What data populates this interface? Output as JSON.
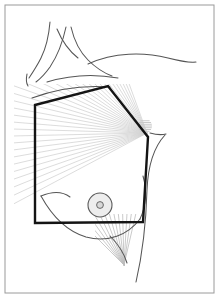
{
  "figure": {
    "caption": "",
    "width": 219,
    "height": 298,
    "background_color": "#ffffff"
  },
  "frame": {
    "name": "figure-border",
    "x": 5,
    "y": 5,
    "width": 209,
    "height": 288,
    "stroke_color": "#9a9a9a",
    "stroke_width": 1
  },
  "colors": {
    "field_outline": "#141414",
    "body_contour": "#555555",
    "ray_light": "#d3d3d3",
    "ray_mid": "#bdbdbd",
    "areola_stroke": "#5a5a5a",
    "areola_fill": "#ededed",
    "nipple_fill": "#d8d8d8",
    "axilla_shade": "#c9c9c9",
    "frame": "#9a9a9a"
  },
  "treatment_field": {
    "name": "tangential-field-polygon",
    "shape": "pentagon",
    "stroke_width": 2.4,
    "stroke_color": "#141414",
    "vertices": [
      {
        "label": "superomedial",
        "x": 35,
        "y": 105
      },
      {
        "label": "superior-apex",
        "x": 108,
        "y": 86
      },
      {
        "label": "lateral-apex",
        "x": 148,
        "y": 137
      },
      {
        "label": "inferolateral",
        "x": 143,
        "y": 222
      },
      {
        "label": "inferomedial",
        "x": 35,
        "y": 223
      }
    ]
  },
  "ray_fan_main": {
    "name": "primary-beam-fan",
    "apex_x": 147,
    "apex_y": 133,
    "count": 34,
    "angle_start_deg": 152,
    "angle_end_deg": 250,
    "length": 185,
    "stroke_color": "#d3d3d3",
    "stroke_width": 0.8
  },
  "ray_fan_inferior": {
    "name": "inframammary-beam-fan",
    "apex_x": 124,
    "apex_y": 265,
    "count": 13,
    "angle_start_deg": 225,
    "angle_end_deg": 283,
    "length": 70,
    "stroke_color": "#bdbdbd",
    "stroke_width": 0.8
  },
  "areola": {
    "name": "nipple-areola-complex",
    "center_x": 100,
    "center_y": 205,
    "outer_radius": 12,
    "inner_radius": 3.4,
    "outer_stroke": "#5a5a5a",
    "outer_fill": "#ededed",
    "inner_fill": "#d8d8d8"
  },
  "axilla_marker": {
    "name": "axillary-apex-shading",
    "center_x": 145,
    "center_y": 126,
    "radius": 7,
    "fill": "#c9c9c9"
  },
  "body_contours": [
    {
      "name": "neck-anterior-border",
      "path": "M 50 22 C 49 34, 47 46, 41 58 C 37 66, 33 72, 29 78"
    },
    {
      "name": "sternocleidomastoid-medial",
      "path": "M 66 27 C 63 41, 58 55, 50 67 C 45 74, 40 79, 36 82"
    },
    {
      "name": "sternocleidomastoid-lateral",
      "path": "M 71 27 C 74 40, 80 52, 88 60 C 96 68, 104 73, 112 76"
    },
    {
      "name": "supraclavicular-fossa",
      "path": "M 57 29 C 62 41, 69 51, 78 58"
    },
    {
      "name": "neck-base-tick",
      "path": "M 27 74 C 26 79, 26 83, 28 86"
    },
    {
      "name": "clavicle-line",
      "path": "M 47 82 C 70 75, 96 74, 118 78"
    },
    {
      "name": "shoulder-trapezius-line",
      "path": "M 88 64 C 114 52, 144 52, 168 58 C 180 61, 188 63, 196 62"
    },
    {
      "name": "chest-upper-slope",
      "path": "M 32 98 C 56 89, 84 85, 110 87"
    },
    {
      "name": "breast-superior-contour",
      "path": "M 41 196 C 53 191, 62 191, 70 197"
    },
    {
      "name": "breast-inferior-contour",
      "path": "M 41 196 C 52 216, 66 231, 86 237 C 108 243, 128 235, 140 219"
    },
    {
      "name": "breast-lateral-contour",
      "path": "M 140 219 C 146 206, 147 190, 143 176"
    },
    {
      "name": "lateral-torso-arm-line",
      "path": "M 165 135 C 153 148, 148 166, 147 190 C 146 226, 142 256, 136 282"
    },
    {
      "name": "axillary-fold-line",
      "path": "M 150 133 C 157 135, 162 135, 166 134"
    },
    {
      "name": "inframammary-crease",
      "path": "M 110 236 C 118 244, 124 253, 127 263"
    }
  ],
  "legend": {
    "visible": false,
    "entries": []
  },
  "annotations": []
}
